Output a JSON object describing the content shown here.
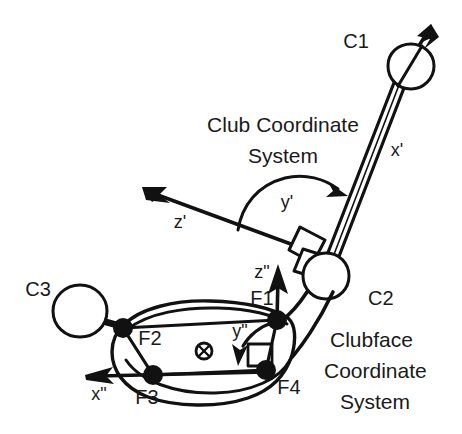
{
  "figure": {
    "background_color": "#ffffff",
    "ink_color": "#111111",
    "width": 462,
    "height": 434
  },
  "captions": {
    "club_system_line1": "Club Coordinate",
    "club_system_line2": "System",
    "clubface_system_line1": "Clubface",
    "clubface_system_line2": "Coordinate",
    "clubface_system_line3": "System"
  },
  "club_axes": {
    "x_axis_label": "x'",
    "z_axis_label": "z'",
    "y_axis_label": "y'"
  },
  "clubface_axes": {
    "x_axis_label": "x\"",
    "z_axis_label": "z\"",
    "y_axis_label": "y\"",
    "into_page_symbol": "circled-x"
  },
  "club_markers": [
    {
      "id": "C1",
      "label": "C1",
      "description": "grip end marker"
    },
    {
      "id": "C2",
      "label": "C2",
      "description": "hosel / head joint marker"
    },
    {
      "id": "C3",
      "label": "C3",
      "description": "toe end marker"
    }
  ],
  "face_markers": [
    {
      "id": "F1",
      "label": "F1",
      "description": "clubface heel-top corner"
    },
    {
      "id": "F2",
      "label": "F2",
      "description": "clubface toe-top corner"
    },
    {
      "id": "F3",
      "label": "F3",
      "description": "clubface toe-bottom corner"
    },
    {
      "id": "F4",
      "label": "F4",
      "description": "clubface heel-bottom corner"
    }
  ]
}
